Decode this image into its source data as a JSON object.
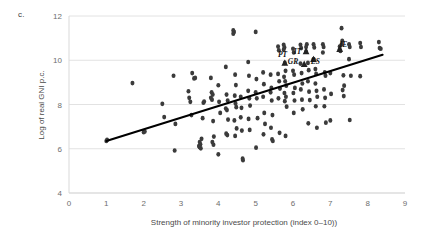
{
  "figure": {
    "panel_label": "c.",
    "background_color": "#ffffff",
    "point_color": "#3b3b3b",
    "trendline_color": "#000000",
    "gridline_color": "#e2e2e2"
  },
  "chart_data": {
    "type": "scatter",
    "title": "",
    "xlabel": "Strength of minority investor protection (index 0–10))",
    "ylabel": "Log of real GNI p.c.",
    "xlim": [
      0,
      9
    ],
    "ylim": [
      4,
      12
    ],
    "xticks": [
      0,
      1,
      2,
      3,
      4,
      5,
      6,
      7,
      8,
      9
    ],
    "yticks": [
      4,
      6,
      8,
      10,
      12
    ],
    "xtick_labels": [
      "0",
      "1",
      "2",
      "3",
      "4",
      "5",
      "6",
      "7",
      "8",
      "9"
    ],
    "ytick_labels": [
      "4",
      "6",
      "8",
      "10",
      "12"
    ],
    "grid": true,
    "grid_axis": "y",
    "legend": "none",
    "trendline": {
      "type": "linear",
      "x_start": 1.0,
      "y_start": 6.35,
      "x_end": 8.4,
      "y_end": 10.25,
      "slope": 0.527,
      "intercept": 5.823
    },
    "annotations": [
      {
        "label": "PT",
        "x": 5.72,
        "y": 10.15,
        "marker": "triangle",
        "marker_x": 5.78,
        "marker_y": 9.88
      },
      {
        "label": "IT",
        "x": 6.12,
        "y": 10.3,
        "marker": "triangle",
        "marker_x": 6.35,
        "marker_y": 10.4
      },
      {
        "label": "GR",
        "x": 6.0,
        "y": 9.85,
        "marker": "triangle",
        "marker_x": 6.3,
        "marker_y": 9.83
      },
      {
        "label": "ES",
        "x": 6.6,
        "y": 9.82,
        "marker": "triangle",
        "marker_x": 6.55,
        "marker_y": 10.05
      },
      {
        "label": "IE",
        "x": 7.35,
        "y": 10.62,
        "marker": "triangle",
        "marker_x": 7.25,
        "marker_y": 10.5
      }
    ],
    "points": [
      [
        1.0,
        6.35
      ],
      [
        1.02,
        6.4
      ],
      [
        1.7,
        8.97
      ],
      [
        2.0,
        6.75
      ],
      [
        2.03,
        6.78
      ],
      [
        2.5,
        8.03
      ],
      [
        2.55,
        7.43
      ],
      [
        2.8,
        9.3
      ],
      [
        2.83,
        5.92
      ],
      [
        2.85,
        7.12
      ],
      [
        3.2,
        8.6
      ],
      [
        3.22,
        8.3
      ],
      [
        3.25,
        8.12
      ],
      [
        3.28,
        7.52
      ],
      [
        3.3,
        9.42
      ],
      [
        3.35,
        9.18
      ],
      [
        3.38,
        9.2
      ],
      [
        3.5,
        6.3
      ],
      [
        3.52,
        6.2
      ],
      [
        3.5,
        6.07
      ],
      [
        3.53,
        6.02
      ],
      [
        3.48,
        6.12
      ],
      [
        3.55,
        6.45
      ],
      [
        3.6,
        8.08
      ],
      [
        3.62,
        8.13
      ],
      [
        3.58,
        7.38
      ],
      [
        3.8,
        9.2
      ],
      [
        3.82,
        8.55
      ],
      [
        3.85,
        8.45
      ],
      [
        3.8,
        8.3
      ],
      [
        3.83,
        8.22
      ],
      [
        3.86,
        7.25
      ],
      [
        3.88,
        6.55
      ],
      [
        3.84,
        6.3
      ],
      [
        3.87,
        6.18
      ],
      [
        4.0,
        8.87
      ],
      [
        4.02,
        8.12
      ],
      [
        4.05,
        7.62
      ],
      [
        4.0,
        5.75
      ],
      [
        4.2,
        9.7
      ],
      [
        4.22,
        8.45
      ],
      [
        4.25,
        8.18
      ],
      [
        4.2,
        7.82
      ],
      [
        4.23,
        7.75
      ],
      [
        4.26,
        7.32
      ],
      [
        4.21,
        6.68
      ],
      [
        4.24,
        6.62
      ],
      [
        4.4,
        11.35
      ],
      [
        4.42,
        11.28
      ],
      [
        4.4,
        11.2
      ],
      [
        4.45,
        9.35
      ],
      [
        4.47,
        8.88
      ],
      [
        4.44,
        8.4
      ],
      [
        4.46,
        8.05
      ],
      [
        4.48,
        7.88
      ],
      [
        4.43,
        7.28
      ],
      [
        4.49,
        6.92
      ],
      [
        4.45,
        6.58
      ],
      [
        4.6,
        8.35
      ],
      [
        4.62,
        7.85
      ],
      [
        4.6,
        7.42
      ],
      [
        4.63,
        6.82
      ],
      [
        4.65,
        5.55
      ],
      [
        4.66,
        5.48
      ],
      [
        4.8,
        9.92
      ],
      [
        4.82,
        9.3
      ],
      [
        4.8,
        8.62
      ],
      [
        4.83,
        8.28
      ],
      [
        4.85,
        7.95
      ],
      [
        4.81,
        7.35
      ],
      [
        4.84,
        6.85
      ],
      [
        5.0,
        11.28
      ],
      [
        5.02,
        9.15
      ],
      [
        5.0,
        8.55
      ],
      [
        5.03,
        8.28
      ],
      [
        5.05,
        7.38
      ],
      [
        5.01,
        6.05
      ],
      [
        5.2,
        9.45
      ],
      [
        5.22,
        8.92
      ],
      [
        5.2,
        8.35
      ],
      [
        5.23,
        7.62
      ],
      [
        5.25,
        7.12
      ],
      [
        5.21,
        6.65
      ],
      [
        5.4,
        9.35
      ],
      [
        5.42,
        8.75
      ],
      [
        5.4,
        8.55
      ],
      [
        5.43,
        8.18
      ],
      [
        5.45,
        7.52
      ],
      [
        5.41,
        6.95
      ],
      [
        5.44,
        6.42
      ],
      [
        5.46,
        6.35
      ],
      [
        5.6,
        10.62
      ],
      [
        5.62,
        10.45
      ],
      [
        5.6,
        9.38
      ],
      [
        5.63,
        9.05
      ],
      [
        5.65,
        8.72
      ],
      [
        5.61,
        8.28
      ],
      [
        5.64,
        6.72
      ],
      [
        5.75,
        10.7
      ],
      [
        5.77,
        10.58
      ],
      [
        5.75,
        10.48
      ],
      [
        5.78,
        9.88
      ],
      [
        5.8,
        9.52
      ],
      [
        5.76,
        9.25
      ],
      [
        5.79,
        9.05
      ],
      [
        5.82,
        8.85
      ],
      [
        5.77,
        8.52
      ],
      [
        5.81,
        8.35
      ],
      [
        5.78,
        8.15
      ],
      [
        5.83,
        7.9
      ],
      [
        5.8,
        6.58
      ],
      [
        6.0,
        10.52
      ],
      [
        6.02,
        10.35
      ],
      [
        6.0,
        9.52
      ],
      [
        6.03,
        9.35
      ],
      [
        6.05,
        8.75
      ],
      [
        6.01,
        8.52
      ],
      [
        6.04,
        8.18
      ],
      [
        6.02,
        7.62
      ],
      [
        6.2,
        10.7
      ],
      [
        6.22,
        10.55
      ],
      [
        6.2,
        9.85
      ],
      [
        6.23,
        9.42
      ],
      [
        6.25,
        8.95
      ],
      [
        6.21,
        8.68
      ],
      [
        6.24,
        8.22
      ],
      [
        6.26,
        7.78
      ],
      [
        6.35,
        10.4
      ],
      [
        6.37,
        10.72
      ],
      [
        6.35,
        10.6
      ],
      [
        6.4,
        9.88
      ],
      [
        6.42,
        9.55
      ],
      [
        6.4,
        9.05
      ],
      [
        6.43,
        8.58
      ],
      [
        6.45,
        8.2
      ],
      [
        6.41,
        7.15
      ],
      [
        6.55,
        10.72
      ],
      [
        6.57,
        10.58
      ],
      [
        6.55,
        10.05
      ],
      [
        6.6,
        9.6
      ],
      [
        6.62,
        9.38
      ],
      [
        6.6,
        8.95
      ],
      [
        6.63,
        8.62
      ],
      [
        6.65,
        8.35
      ],
      [
        6.61,
        7.92
      ],
      [
        6.64,
        6.95
      ],
      [
        6.8,
        10.72
      ],
      [
        6.82,
        10.6
      ],
      [
        6.8,
        10.35
      ],
      [
        6.85,
        9.45
      ],
      [
        6.87,
        9.3
      ],
      [
        6.83,
        8.68
      ],
      [
        6.86,
        8.3
      ],
      [
        6.84,
        7.92
      ],
      [
        6.88,
        7.18
      ],
      [
        7.0,
        9.42
      ],
      [
        7.02,
        8.48
      ],
      [
        7.0,
        7.28
      ],
      [
        7.25,
        10.5
      ],
      [
        7.27,
        10.42
      ],
      [
        7.25,
        10.62
      ],
      [
        7.3,
        11.45
      ],
      [
        7.32,
        10.88
      ],
      [
        7.3,
        10.72
      ],
      [
        7.35,
        9.32
      ],
      [
        7.37,
        8.85
      ],
      [
        7.33,
        8.65
      ],
      [
        7.36,
        8.38
      ],
      [
        7.5,
        10.72
      ],
      [
        7.52,
        10.6
      ],
      [
        7.5,
        10.05
      ],
      [
        7.55,
        9.3
      ],
      [
        7.52,
        7.3
      ],
      [
        7.8,
        10.78
      ],
      [
        7.82,
        10.6
      ],
      [
        7.8,
        9.28
      ],
      [
        8.3,
        10.82
      ],
      [
        8.32,
        10.55
      ],
      [
        8.35,
        10.52
      ]
    ]
  }
}
